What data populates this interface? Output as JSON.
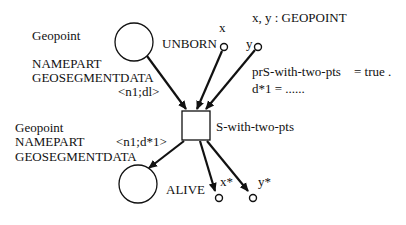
{
  "places": {
    "unborn": {
      "label": "UNBORN",
      "type_lines": [
        "Geopoint",
        "NAMEPART",
        "GEOSEGMENTDATA"
      ]
    },
    "alive": {
      "label": "ALIVE",
      "type_lines": [
        "Geopoint",
        "NAMEPART",
        "GEOSEGMENTDATA"
      ]
    },
    "x": {
      "label": "x"
    },
    "y": {
      "label": "y"
    },
    "x_star": {
      "label": "x*"
    },
    "y_star": {
      "label": "y*"
    }
  },
  "transition": {
    "label": "S-with-two-pts"
  },
  "arcs": {
    "input_label": "<n1;dl>",
    "output_label": "<n1;d*1>"
  },
  "declarations": {
    "variables": "x, y : GEOPOINT",
    "predicate_name": "prS-with-two-pts",
    "predicate_value": "= true .",
    "assignment": "d*1  = ......"
  },
  "colors": {
    "stroke": "#111111",
    "background": "#ffffff"
  }
}
